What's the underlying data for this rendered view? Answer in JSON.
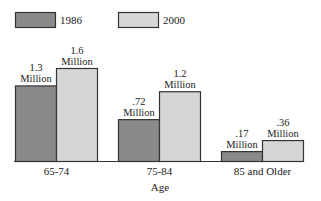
{
  "chart_data": {
    "type": "bar",
    "title": "",
    "xlabel": "Age",
    "ylabel": "",
    "categories": [
      "65-74",
      "75-84",
      "85 and Older"
    ],
    "series": [
      {
        "name": "1986",
        "values": [
          1.3,
          0.72,
          0.17
        ],
        "labels": [
          [
            "1.3",
            "Million"
          ],
          [
            ".72",
            "Million"
          ],
          [
            ".17",
            "Million"
          ]
        ],
        "color": "#8a8a8a"
      },
      {
        "name": "2000",
        "values": [
          1.6,
          1.2,
          0.36
        ],
        "labels": [
          [
            "1.6",
            "Million"
          ],
          [
            "1.2",
            "Million"
          ],
          [
            ".36",
            "Million"
          ]
        ],
        "color": "#d6d6d6"
      }
    ],
    "units": "Million",
    "ylim": [
      0,
      1.6
    ],
    "grid": false,
    "legend": "top-left",
    "outline_color": "#333333"
  }
}
